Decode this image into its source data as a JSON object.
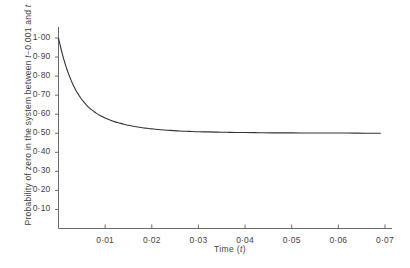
{
  "chart_data": {
    "type": "line",
    "title": "",
    "subtitle": "",
    "xlabel_prefix": "Time  (",
    "xlabel_symbol": "t",
    "xlabel_suffix": ")",
    "ylabel_part1": "Probability of zero in the system between ",
    "ylabel_symbol1": "t",
    "ylabel_part2": "−0.001 and ",
    "ylabel_symbol2": "t",
    "xlabel": "Time (t)",
    "ylabel": "Probability of zero in the system between t−0.001 and t",
    "xlim": [
      0,
      0.0071
    ],
    "ylim": [
      0,
      1.04
    ],
    "grid": false,
    "legend": false,
    "legend_position": "none",
    "xticks": [
      0.01,
      0.02,
      0.03,
      0.04,
      0.05,
      0.06,
      0.07
    ],
    "xticklabels": [
      "0·01",
      "0·02",
      "0·03",
      "0·04",
      "0·05",
      "0·06",
      "0·07"
    ],
    "yticks": [
      0.1,
      0.2,
      0.3,
      0.4,
      0.5,
      0.6,
      0.7,
      0.8,
      0.9,
      1.0
    ],
    "yticklabels": [
      "0·10",
      "0·20",
      "0·30",
      "0·40",
      "0·50",
      "0·60",
      "0·70",
      "0·80",
      "0·90",
      "1·00"
    ],
    "series": [
      {
        "name": "Probability of zero in system",
        "color": "#333333",
        "linewidth": 1,
        "x": [
          0.0,
          0.0002,
          0.0004,
          0.0006,
          0.0008,
          0.001,
          0.0012,
          0.0014,
          0.0016,
          0.0018,
          0.002,
          0.0022,
          0.0024,
          0.0026,
          0.0028,
          0.003,
          0.0034,
          0.0038,
          0.0042,
          0.0046,
          0.005,
          0.0055,
          0.006,
          0.0065,
          0.007,
          0.0075,
          0.008,
          0.009,
          0.01,
          0.011,
          0.012,
          0.013,
          0.014,
          0.015,
          0.016,
          0.017,
          0.018,
          0.019,
          0.02,
          0.022,
          0.024,
          0.026,
          0.028,
          0.03,
          0.032,
          0.034,
          0.036,
          0.038,
          0.04,
          0.043,
          0.046,
          0.05,
          0.054,
          0.058,
          0.062,
          0.066,
          0.069
        ],
        "y": [
          1.0,
          0.978,
          0.957,
          0.937,
          0.918,
          0.9,
          0.883,
          0.867,
          0.851,
          0.836,
          0.822,
          0.809,
          0.796,
          0.784,
          0.772,
          0.761,
          0.741,
          0.722,
          0.706,
          0.691,
          0.677,
          0.662,
          0.648,
          0.636,
          0.625,
          0.616,
          0.607,
          0.592,
          0.58,
          0.57,
          0.561,
          0.554,
          0.547,
          0.542,
          0.537,
          0.533,
          0.529,
          0.526,
          0.523,
          0.518,
          0.515,
          0.512,
          0.51,
          0.508,
          0.507,
          0.506,
          0.505,
          0.504,
          0.504,
          0.503,
          0.502,
          0.502,
          0.501,
          0.501,
          0.501,
          0.5,
          0.5
        ]
      }
    ],
    "asymptote": 0.5,
    "start_value": 1.0
  },
  "axes": {
    "y_axis_name": "y-axis-line",
    "x_axis_name": "x-axis-line"
  }
}
